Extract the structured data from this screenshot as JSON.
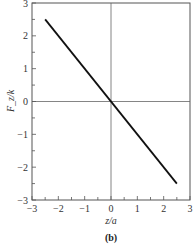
{
  "chart_data": {
    "type": "line",
    "title": "",
    "panel_label": "(b)",
    "xlabel": "z/a",
    "ylabel": "F_z/k",
    "xlim": [
      -3,
      3
    ],
    "ylim": [
      -3,
      3
    ],
    "x_ticks": [
      "-3",
      "-2",
      "-1",
      "0",
      "1",
      "2",
      "3"
    ],
    "y_ticks": [
      "-3",
      "-2",
      "-1",
      "0",
      "1",
      "2",
      "3"
    ],
    "grid": false,
    "zero_lines": true,
    "series": [
      {
        "name": "F_z/k",
        "x": [
          -2.5,
          2.5
        ],
        "y": [
          2.5,
          -2.5
        ],
        "color": "#111111"
      }
    ]
  }
}
